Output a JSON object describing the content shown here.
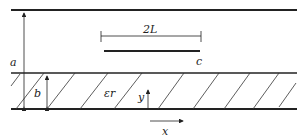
{
  "diagram": {
    "type": "shielded microstrip cross-section",
    "labels": {
      "a": "a",
      "b": "b",
      "length": "2L",
      "strip_end": "c",
      "permittivity": "εr",
      "x_axis": "x",
      "y_axis": "y"
    },
    "colors": {
      "line": "#222222",
      "background": "#ffffff"
    }
  }
}
